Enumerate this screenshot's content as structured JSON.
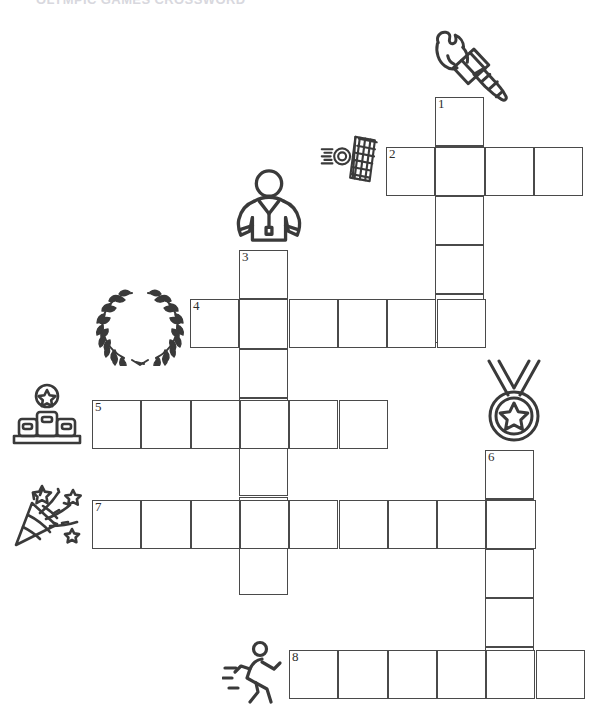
{
  "page": {
    "width": 607,
    "height": 728,
    "background": "#ffffff",
    "ink": "#4a4a4a",
    "heading_clipped": "OLYMPIC GAMES CROSSWORD"
  },
  "grid": {
    "cell_size": 49.3,
    "line_color": "#4a4a4a",
    "entries": [
      {
        "number": "1",
        "direction": "down",
        "x": 435,
        "y": 97,
        "length": 5
      },
      {
        "number": "2",
        "direction": "across",
        "x": 386,
        "y": 147,
        "length": 4
      },
      {
        "number": "3",
        "direction": "down",
        "x": 239,
        "y": 250,
        "length": 7
      },
      {
        "number": "4",
        "direction": "across",
        "x": 190,
        "y": 299,
        "length": 6
      },
      {
        "number": "5",
        "direction": "across",
        "x": 92,
        "y": 400,
        "length": 6
      },
      {
        "number": "6",
        "direction": "down",
        "x": 485,
        "y": 450,
        "length": 5
      },
      {
        "number": "7",
        "direction": "across",
        "x": 92,
        "y": 500,
        "length": 9
      },
      {
        "number": "8",
        "direction": "across",
        "x": 289,
        "y": 650,
        "length": 6
      }
    ],
    "numbers": [
      "1",
      "2",
      "3",
      "4",
      "5",
      "6",
      "7",
      "8"
    ]
  },
  "icons": [
    {
      "id": "torch-icon",
      "label": "torch",
      "x": 424,
      "y": 22,
      "w": 96,
      "h": 86
    },
    {
      "id": "target-icon",
      "label": "target",
      "x": 320,
      "y": 133,
      "w": 62,
      "h": 52
    },
    {
      "id": "athlete-icon",
      "label": "athlete",
      "x": 233,
      "y": 168,
      "w": 72,
      "h": 76
    },
    {
      "id": "laurel-wreath-icon",
      "label": "laurel wreath",
      "x": 94,
      "y": 288,
      "w": 92,
      "h": 78
    },
    {
      "id": "medal-icon",
      "label": "medal",
      "x": 477,
      "y": 358,
      "w": 74,
      "h": 86
    },
    {
      "id": "podium-icon",
      "label": "podium",
      "x": 10,
      "y": 383,
      "w": 74,
      "h": 64
    },
    {
      "id": "party-popper-icon",
      "label": "party popper",
      "x": 10,
      "y": 479,
      "w": 78,
      "h": 72
    },
    {
      "id": "runner-icon",
      "label": "runner",
      "x": 222,
      "y": 640,
      "w": 62,
      "h": 64
    }
  ]
}
